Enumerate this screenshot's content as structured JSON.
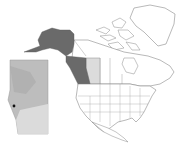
{
  "map": {
    "title": "",
    "region": "North America",
    "colors": {
      "background": "#ffffff",
      "land": "#ffffff",
      "border": "#8a8a8a",
      "highlight_dark": "#6a6a6a",
      "highlight_light": "#dcdcdc",
      "inset_base": "#bdbdbd",
      "inset_light": "#e2e2e2",
      "marker": "#111111"
    },
    "highlighted_regions": [
      {
        "name": "Alaska",
        "shade": "dark"
      },
      {
        "name": "British Columbia",
        "shade": "dark"
      },
      {
        "name": "Washington",
        "shade": "dark"
      },
      {
        "name": "Alberta",
        "shade": "light"
      }
    ],
    "inset": {
      "region": "Alberta",
      "marker": {
        "label": "",
        "position": "southwest"
      }
    }
  }
}
